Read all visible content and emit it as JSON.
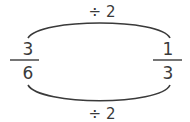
{
  "diagram": {
    "top_operation": "÷ 2",
    "bottom_operation": "÷ 2",
    "left_fraction": {
      "numerator": "3",
      "denominator": "6"
    },
    "right_fraction": {
      "numerator": "1",
      "denominator": "3"
    },
    "colors": {
      "stroke": "#3a3a3a",
      "background": "#ffffff"
    }
  }
}
